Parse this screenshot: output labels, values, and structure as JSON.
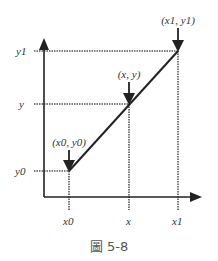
{
  "figure": {
    "caption": "圖 5-8",
    "axes": {
      "y_labels": {
        "y1": "y1",
        "y": "y",
        "y0": "y0"
      },
      "x_labels": {
        "x0": "x0",
        "x": "x",
        "x1": "x1"
      }
    },
    "points": {
      "start": "(x0, y0)",
      "mid": "(x, y)",
      "end": "(x1, y1)"
    },
    "colors": {
      "line": "#222222",
      "dotted": "#444444",
      "text": "#333333"
    }
  }
}
